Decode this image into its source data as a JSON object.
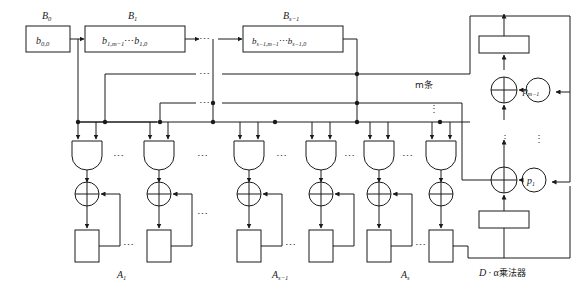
{
  "figure": {
    "title_chinese": "D·α乘法器",
    "bus_label": "m条",
    "ellipsis_h": "⋯",
    "ellipsis_v": "⋮",
    "colors": {
      "line": "#1a1a1a",
      "background": "#ffffff",
      "text": "#1a1a1a",
      "dots": "#3a3a3a"
    }
  },
  "top_registers": [
    {
      "name": "B0",
      "title": "B",
      "title_sub": "0",
      "content_main": "b",
      "content_sub": "0,0"
    },
    {
      "name": "B1",
      "title": "B",
      "title_sub": "1",
      "content_main": "b",
      "content_sub": "1,m−1",
      "content_mid": "⋯",
      "content_main2": "b",
      "content_sub2": "1,0"
    },
    {
      "name": "Bs1",
      "title": "B",
      "title_sub": "s−1",
      "content_main": "b",
      "content_sub": "s−1,m−1",
      "content_mid": "⋯",
      "content_main2": "b",
      "content_sub2": "s−1,0"
    }
  ],
  "bottom_groups": [
    {
      "name": "A1",
      "label_main": "A",
      "label_sub": "1"
    },
    {
      "name": "As1",
      "label_main": "A",
      "label_sub": "s−1"
    },
    {
      "name": "As",
      "label_main": "A",
      "label_sub": "s"
    }
  ],
  "adder_nodes": [
    {
      "name": "p-m-1",
      "label_main": "p",
      "label_sub": "m−1"
    },
    {
      "name": "p-1",
      "label_main": "p",
      "label_sub": "1"
    }
  ],
  "right_blocks": [
    {
      "name": "upper-register",
      "label": ""
    },
    {
      "name": "lower-register",
      "label": ""
    }
  ],
  "multiplier_label": {
    "prefix": "D",
    "dot": "·",
    "alpha": "α",
    "suffix": "乘法器",
    "full": "D · α乘法器"
  },
  "gates": {
    "and_gate_name": "and-gate",
    "xor_gate_name": "xor-gate",
    "register_name": "register-cell"
  }
}
